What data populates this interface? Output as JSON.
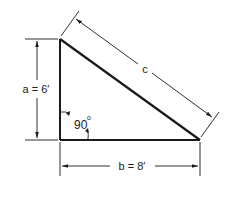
{
  "diagram": {
    "type": "right-triangle-dimension-drawing",
    "labels": {
      "side_a": "a  =  6′",
      "side_b": "b  =  8′",
      "side_c": "c",
      "right_angle": "90",
      "degree_symbol": "o"
    },
    "values": {
      "a_ft": 6,
      "b_ft": 8,
      "angle_deg": 90
    },
    "colors": {
      "line": "#1a1a1a",
      "background": "#ffffff"
    }
  }
}
